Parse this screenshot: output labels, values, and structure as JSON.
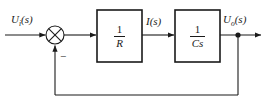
{
  "diagram": {
    "type": "control-system-block-diagram",
    "stroke_color": "#1a1a1a",
    "background_color": "#ffffff",
    "signals": {
      "input": "Uᵢ(s)",
      "input_base": "U",
      "input_sub": "i",
      "input_arg": "(s)",
      "middle": "I(s)",
      "middle_base": "I",
      "middle_arg": "(s)",
      "output": "Uₒ(s)",
      "output_base": "U",
      "output_sub": "o",
      "output_arg": "(s)"
    },
    "summing_junction": {
      "name": "summing-junction",
      "shape": "circle-with-x",
      "inputs": [
        "Uᵢ(s)",
        "feedback"
      ],
      "feedback_sign": "−",
      "cx": 55,
      "cy": 35,
      "r": 9
    },
    "blocks": [
      {
        "name": "block-1-over-R",
        "transfer_function": "1/R",
        "numerator": "1",
        "denominator": "R",
        "x": 97,
        "y": 10,
        "width": 45,
        "height": 52
      },
      {
        "name": "block-1-over-Cs",
        "transfer_function": "1/Cs",
        "numerator": "1",
        "denominator": "Cs",
        "x": 175,
        "y": 10,
        "width": 45,
        "height": 52
      }
    ],
    "takeoff_node": {
      "name": "output-takeoff-node",
      "cx": 238,
      "cy": 35,
      "r": 2.6
    },
    "feedback_path": {
      "name": "feedback-path",
      "from": "output-takeoff-node",
      "to": "summing-junction",
      "bottom_y": 95,
      "sign": "−"
    }
  }
}
